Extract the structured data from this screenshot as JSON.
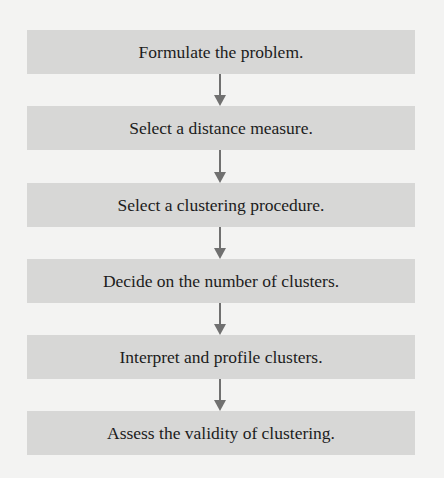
{
  "diagram": {
    "type": "flowchart",
    "steps": [
      {
        "label": "Formulate the problem."
      },
      {
        "label": "Select a distance measure."
      },
      {
        "label": "Select a clustering procedure."
      },
      {
        "label": "Decide on the number of clusters."
      },
      {
        "label": "Interpret and profile clusters."
      },
      {
        "label": "Assess the validity of clustering."
      }
    ],
    "colors": {
      "background": "#f3f3f2",
      "box_fill": "#d7d7d6",
      "arrow": "#707070",
      "text": "#1c1c1c"
    }
  }
}
